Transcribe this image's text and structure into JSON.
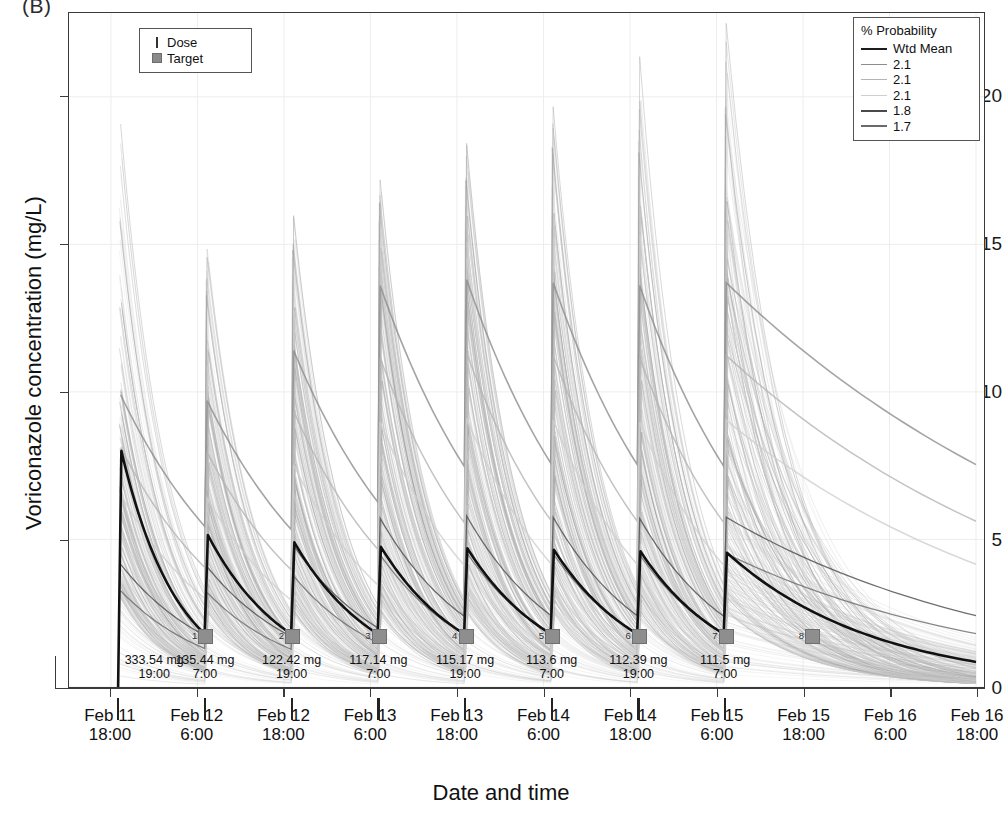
{
  "panel": {
    "label": "(B)"
  },
  "axes": {
    "y_title": "Voriconazole concentration (mg/L)",
    "x_title": "Date and time",
    "y_ticks": [
      "0",
      "5",
      "10",
      "15",
      "20"
    ],
    "x_ticks": [
      {
        "date": "Feb 11",
        "time": "18:00"
      },
      {
        "date": "Feb 12",
        "time": "6:00"
      },
      {
        "date": "Feb 12",
        "time": "18:00"
      },
      {
        "date": "Feb 13",
        "time": "6:00"
      },
      {
        "date": "Feb 13",
        "time": "18:00"
      },
      {
        "date": "Feb 14",
        "time": "6:00"
      },
      {
        "date": "Feb 14",
        "time": "18:00"
      },
      {
        "date": "Feb 15",
        "time": "6:00"
      },
      {
        "date": "Feb 15",
        "time": "18:00"
      },
      {
        "date": "Feb 16",
        "time": "6:00"
      },
      {
        "date": "Feb 16",
        "time": "18:00"
      }
    ]
  },
  "legend_dose": {
    "items": [
      {
        "label": "Dose",
        "marker": "line-icon"
      },
      {
        "label": "Target",
        "marker": "square-icon"
      }
    ]
  },
  "legend_probability": {
    "title": "% Probability",
    "items": [
      {
        "label": "Wtd Mean",
        "color": "#1c1c1c",
        "width": 2.4
      },
      {
        "label": "2.1",
        "color": "#8d8d8d",
        "width": 1.8
      },
      {
        "label": "2.1",
        "color": "#b4b4b4",
        "width": 1.8
      },
      {
        "label": "2.1",
        "color": "#cfcfcf",
        "width": 1.8
      },
      {
        "label": "1.8",
        "color": "#4a4a4a",
        "width": 2.0
      },
      {
        "label": "1.7",
        "color": "#6a6a6a",
        "width": 2.0
      }
    ]
  },
  "doses": [
    {
      "index": 1,
      "amount": "333.54 mg",
      "time": "19:00"
    },
    {
      "index": 2,
      "amount": "135.44 mg",
      "time": "7:00"
    },
    {
      "index": 3,
      "amount": "122.42 mg",
      "time": "19:00"
    },
    {
      "index": 4,
      "amount": "117.14 mg",
      "time": "7:00"
    },
    {
      "index": 5,
      "amount": "115.17 mg",
      "time": "19:00"
    },
    {
      "index": 6,
      "amount": "113.6 mg",
      "time": "7:00"
    },
    {
      "index": 7,
      "amount": "112.39 mg",
      "time": "19:00"
    },
    {
      "index": 8,
      "amount": "111.5 mg",
      "time": "7:00"
    }
  ],
  "chart_data": {
    "type": "line",
    "title": "(B)",
    "xlabel": "Date and time",
    "ylabel": "Voriconazole concentration (mg/L)",
    "ylim": [
      0,
      22.5
    ],
    "yticks": [
      0,
      5,
      10,
      15,
      20
    ],
    "grid": true,
    "legend_position": "top-right",
    "x_start": "Feb 11 18:00",
    "x_end": "Feb 16 18:00",
    "x_tick_hours": 12,
    "dose_events": [
      {
        "n": 1,
        "amount_mg": 333.54,
        "clock": "19:00",
        "hours_from_start": 1
      },
      {
        "n": 2,
        "amount_mg": 135.44,
        "clock": "7:00",
        "hours_from_start": 13
      },
      {
        "n": 3,
        "amount_mg": 122.42,
        "clock": "19:00",
        "hours_from_start": 25
      },
      {
        "n": 4,
        "amount_mg": 117.14,
        "clock": "7:00",
        "hours_from_start": 37
      },
      {
        "n": 5,
        "amount_mg": 115.17,
        "clock": "19:00",
        "hours_from_start": 49
      },
      {
        "n": 6,
        "amount_mg": 113.6,
        "clock": "7:00",
        "hours_from_start": 61
      },
      {
        "n": 7,
        "amount_mg": 112.39,
        "clock": "19:00",
        "hours_from_start": 73
      },
      {
        "n": 8,
        "amount_mg": 111.5,
        "clock": "7:00",
        "hours_from_start": 85
      }
    ],
    "target_markers": [
      {
        "n": 1,
        "hours_from_start": 13,
        "concentration": 1.8
      },
      {
        "n": 2,
        "hours_from_start": 25,
        "concentration": 1.8
      },
      {
        "n": 3,
        "hours_from_start": 37,
        "concentration": 1.8
      },
      {
        "n": 4,
        "hours_from_start": 49,
        "concentration": 1.8
      },
      {
        "n": 5,
        "hours_from_start": 61,
        "concentration": 1.8
      },
      {
        "n": 6,
        "hours_from_start": 73,
        "concentration": 1.8
      },
      {
        "n": 7,
        "hours_from_start": 85,
        "concentration": 1.8
      },
      {
        "n": 8,
        "hours_from_start": 97,
        "concentration": 1.8
      }
    ],
    "series": [
      {
        "name": "Wtd Mean",
        "style": "bold-black",
        "peaks": [
          8.0,
          5.15,
          4.9,
          4.75,
          4.7,
          4.65,
          4.6,
          4.55
        ],
        "troughs": [
          1.8,
          1.8,
          1.8,
          1.8,
          1.8,
          1.8,
          1.8,
          1.8
        ],
        "terminal_value": 0.85
      },
      {
        "name": "Population profiles",
        "style": "light-grey-spaghetti",
        "peak_envelope_max": [
          19.2,
          15.1,
          16.0,
          17.2,
          18.6,
          19.8,
          21.0,
          22.2
        ],
        "peak_envelope_typical": [
          9.9,
          9.7,
          11.4,
          13.6,
          13.8,
          13.7,
          13.6,
          13.7
        ],
        "peak_envelope_low": [
          3.0,
          2.6,
          2.5,
          2.5,
          2.5,
          2.5,
          2.5,
          2.5
        ]
      }
    ]
  }
}
